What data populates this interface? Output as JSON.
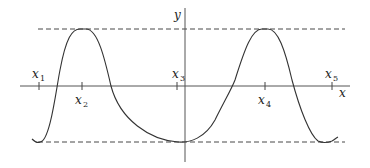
{
  "diagram": {
    "type": "function-graph",
    "axes": {
      "x_label": "x",
      "y_label": "y"
    },
    "points": [
      {
        "name": "x",
        "sub": "1",
        "position": "above-axis"
      },
      {
        "name": "x",
        "sub": "2",
        "position": "below-axis"
      },
      {
        "name": "x",
        "sub": "3",
        "position": "above-axis"
      },
      {
        "name": "x",
        "sub": "4",
        "position": "below-axis"
      },
      {
        "name": "x",
        "sub": "5",
        "position": "above-axis"
      }
    ],
    "reference_lines": [
      {
        "name": "maximum-level",
        "style": "dashed"
      },
      {
        "name": "minimum-level",
        "style": "dashed"
      }
    ],
    "curve": {
      "description": "periodic-like curve with minima near x1, x3, x5 and maxima at x2 and x4",
      "color": "#333333"
    }
  }
}
